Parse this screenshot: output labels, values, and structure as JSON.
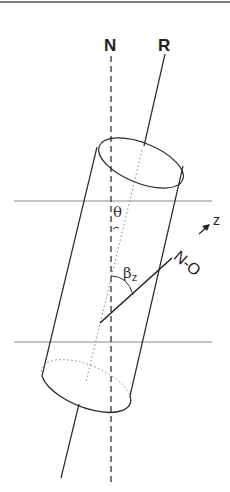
{
  "figure": {
    "labels": {
      "normal_axis": "N",
      "rotor_axis": "R",
      "tilt_angle": "θ",
      "bond_angle": "β",
      "bond_angle_subscript": "z",
      "bond_vector": "N-O",
      "z_axis": "z"
    },
    "colors": {
      "line": "#2a2a2a",
      "dashed": "#333333",
      "dotted": "#777777",
      "plane": "#8a8a8a",
      "border": "#555555"
    },
    "icons": [
      "z-direction-arrow-icon"
    ]
  }
}
